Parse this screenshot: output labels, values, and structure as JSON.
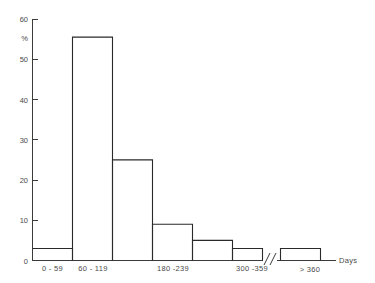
{
  "chart_data": {
    "type": "bar",
    "title": "",
    "subtitle": "",
    "xlabel": "Days",
    "ylabel": "%",
    "categories": [
      "0 - 59",
      "60 - 119",
      "120 - 179",
      "180 - 239",
      "240 - 299",
      "300 - 359",
      "> 360"
    ],
    "visible_tick_labels": [
      "0 - 59",
      "60 - 119",
      "180 -239",
      "300 -359",
      "> 360"
    ],
    "values": [
      3,
      55.5,
      25,
      9,
      5,
      3,
      3
    ],
    "bars": [
      {
        "label": "0 - 59",
        "value": 3,
        "label_shown": true
      },
      {
        "label": "60 - 119",
        "value": 55.5,
        "label_shown": true
      },
      {
        "label": "120 - 179",
        "value": 25,
        "label_shown": false
      },
      {
        "label": "180 -239",
        "value": 9,
        "label_shown": true
      },
      {
        "label": "240 - 299",
        "value": 5,
        "label_shown": false
      },
      {
        "label": "300 -359",
        "value": 3,
        "label_shown": true
      },
      {
        "label": "> 360",
        "value": 3,
        "label_shown": true
      }
    ],
    "ylim": [
      0,
      60
    ],
    "yticks": [
      0,
      10,
      20,
      30,
      40,
      50,
      60
    ],
    "ytick_labels": [
      "0",
      "10",
      "20",
      "30",
      "40",
      "50",
      "60"
    ],
    "grid": false,
    "legend": false,
    "axis_break": "//",
    "axis_break_note": "x-axis break between 300-359 bin and > 360 bin",
    "colors": {
      "bar_outline": "#2a2a2a",
      "axis": "#3b3b3b",
      "text": "#4a4a4a",
      "background": "#ffffff"
    }
  },
  "labels": {
    "y_unit": "%",
    "x_title": "Days",
    "y_tick_0": "0",
    "y_tick_10": "10",
    "y_tick_20": "20",
    "y_tick_30": "30",
    "y_tick_40": "40",
    "y_tick_50": "50",
    "y_tick_60": "60",
    "x_tick_1": "0 - 59",
    "x_tick_2": "60 - 119",
    "x_tick_3": "180 -239",
    "x_tick_4": "300 -359",
    "x_tick_5": "> 360"
  }
}
